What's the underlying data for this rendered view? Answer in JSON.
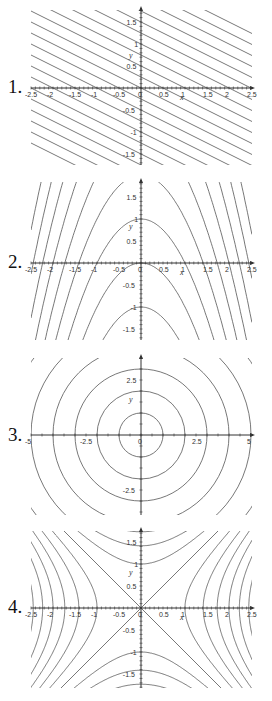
{
  "chart_data": [
    {
      "type": "line",
      "label": "1.",
      "title": "Level curves of f(x,y)=x+2y (parallel lines)",
      "family": "lines",
      "xlabel": "x",
      "ylabel": "y",
      "xlim": [
        -2.5,
        2.5
      ],
      "ylim": [
        -1.75,
        1.75
      ],
      "xticks": [
        "-2.5",
        "-2",
        "-1.5",
        "-1",
        "-0.5",
        "0",
        "0.5",
        "1",
        "1.5",
        "2",
        "2.5"
      ],
      "yticks": [
        "1.5",
        "1",
        "0.5",
        "-0.5",
        "-1",
        "-1.5"
      ],
      "levels": [
        -5,
        -4.5,
        -4,
        -3.5,
        -3,
        -2.5,
        -2,
        -1.5,
        -1,
        -0.5,
        0,
        0.5,
        1,
        1.5,
        2,
        2.5,
        3,
        3.5,
        4,
        4.5,
        5
      ]
    },
    {
      "type": "line",
      "label": "2.",
      "title": "Level curves y = c - x^2 (downward parabolas)",
      "family": "parabolas",
      "xlabel": "x",
      "ylabel": "y",
      "xlim": [
        -2.5,
        2.5
      ],
      "ylim": [
        -1.75,
        1.75
      ],
      "xticks": [
        "-2.5",
        "-2",
        "-1.5",
        "-1",
        "-0.5",
        "0",
        "0.5",
        "1",
        "1.5",
        "2",
        "2.5"
      ],
      "yticks": [
        "1.5",
        "1",
        "0.5",
        "-0.5",
        "-1",
        "-1.5"
      ],
      "levels": [
        -1,
        0,
        1,
        2,
        3,
        4,
        5,
        6,
        7
      ]
    },
    {
      "type": "line",
      "label": "3.",
      "title": "Level curves x^2 + y^2 = c (concentric circles)",
      "family": "circles",
      "xlabel": "",
      "ylabel": "y",
      "xlim": [
        -5,
        5
      ],
      "ylim": [
        -3.5,
        3.5
      ],
      "xticks": [
        "-5",
        "-2.5",
        "0",
        "2.5",
        "5"
      ],
      "yticks": [
        "2.5",
        "-2.5"
      ],
      "radii": [
        1,
        2,
        3,
        4,
        5,
        6,
        7
      ]
    },
    {
      "type": "line",
      "label": "4.",
      "title": "Level curves x^2 - y^2 = c (hyperbolas)",
      "family": "hyperbolas",
      "xlabel": "x",
      "ylabel": "y",
      "xlim": [
        -2.5,
        2.5
      ],
      "ylim": [
        -1.75,
        1.75
      ],
      "xticks": [
        "-2.5",
        "-2",
        "-1.5",
        "-1",
        "-0.5",
        "0",
        "0.5",
        "1",
        "1.5",
        "2",
        "2.5"
      ],
      "yticks": [
        "1.5",
        "1",
        "0.5",
        "-0.5",
        "-1",
        "-1.5"
      ],
      "levels": [
        -3,
        -2,
        -1,
        0,
        1,
        2,
        3,
        4,
        5,
        6
      ]
    }
  ],
  "labels": {
    "p1": "1.",
    "p2": "2.",
    "p3": "3.",
    "p4": "4."
  },
  "colors": {
    "curve": "#555555",
    "axis": "#333333"
  }
}
